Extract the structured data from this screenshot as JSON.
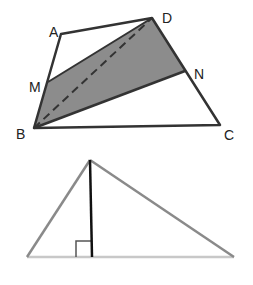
{
  "figure1": {
    "description": "Quadrilateral ABCD with shaded region B-M-D-N and dashed diagonal BD",
    "vertex_labels": {
      "A": "A",
      "B": "B",
      "C": "C",
      "D": "D",
      "M": "M",
      "N": "N"
    },
    "shaded_region": [
      "B",
      "M",
      "D",
      "N"
    ],
    "dashed_segment": [
      "B",
      "D"
    ],
    "colors": {
      "outline": "#333333",
      "shade": "#8c8c8c",
      "dash": "#333333"
    }
  },
  "figure2": {
    "description": "Triangle with an altitude from the top vertex to the base, marked with a right-angle symbol",
    "colors": {
      "sides": "#8a8a8a",
      "base": "#c8c8c8",
      "altitude": "#111111",
      "right_angle_marker": "#555555"
    }
  }
}
